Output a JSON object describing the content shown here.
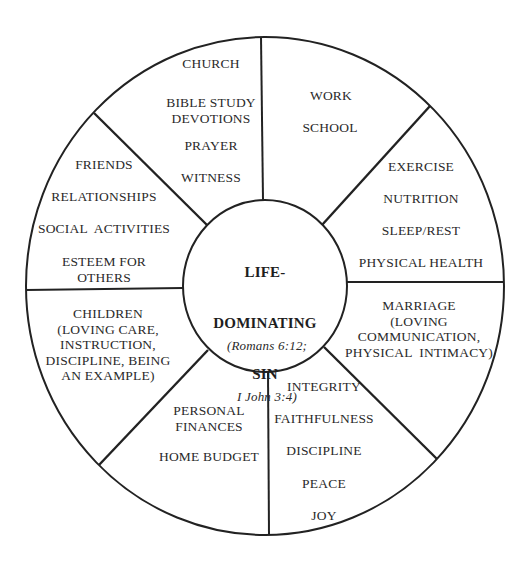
{
  "diagram": {
    "type": "wheel",
    "line_color": "#222222",
    "text_color": "#2a2a2a",
    "center": {
      "title_lines": [
        "LIFE-",
        "DOMINATING",
        "SIN"
      ],
      "reference_lines": [
        "(Romans 6:12;",
        "I John 3:4)"
      ]
    },
    "segments": [
      {
        "id": "spiritual",
        "items": [
          "CHURCH",
          "BIBLE STUDY\nDEVOTIONS",
          "PRAYER",
          "WITNESS"
        ]
      },
      {
        "id": "vocation",
        "items": [
          "WORK",
          "SCHOOL"
        ]
      },
      {
        "id": "physical",
        "items": [
          "EXERCISE",
          "NUTRITION",
          "SLEEP/REST",
          "PHYSICAL HEALTH"
        ]
      },
      {
        "id": "marriage",
        "items": [
          "MARRIAGE\n(LOVING\nCOMMUNICATION,\nPHYSICAL  INTIMACY)"
        ]
      },
      {
        "id": "character",
        "items": [
          "INTEGRITY",
          "FAITHFULNESS",
          "DISCIPLINE",
          "PEACE",
          "JOY"
        ]
      },
      {
        "id": "finances",
        "items": [
          "PERSONAL\nFINANCES",
          "HOME BUDGET"
        ]
      },
      {
        "id": "children",
        "items": [
          "CHILDREN\n(LOVING CARE,\nINSTRUCTION,\nDISCIPLINE, BEING\nAN EXAMPLE)"
        ]
      },
      {
        "id": "social",
        "items": [
          "FRIENDS",
          "RELATIONSHIPS",
          "SOCIAL  ACTIVITIES",
          "ESTEEM FOR\nOTHERS"
        ]
      }
    ]
  }
}
